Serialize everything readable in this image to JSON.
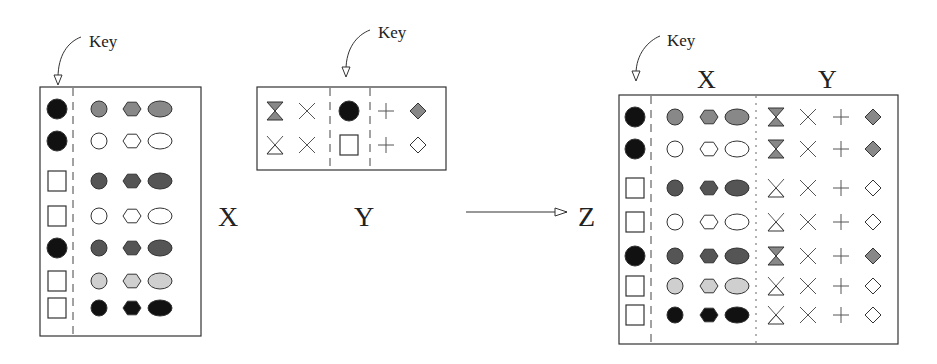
{
  "colors": {
    "black": "#111111",
    "dark_gray": "#555555",
    "mid_gray": "#888888",
    "light_gray": "#cfcfcf",
    "white": "#ffffff",
    "stroke": "#333333"
  },
  "labels": {
    "key_x": "Key",
    "key_y": "Key",
    "key_z": "Key",
    "table_x": "X",
    "table_y": "Y",
    "table_z": "Z",
    "z_header_x": "X",
    "z_header_y": "Y"
  },
  "table_x": {
    "key_column": [
      "filled-circle",
      "filled-circle",
      "empty-square",
      "empty-square",
      "filled-circle",
      "empty-square",
      "empty-square"
    ],
    "rows_fill": [
      "mid_gray",
      "white",
      "dark_gray",
      "white",
      "dark_gray",
      "light_gray",
      "black"
    ],
    "columns": [
      "circle",
      "hexagon",
      "ellipse"
    ]
  },
  "table_y": {
    "key_column": [
      "filled-circle",
      "empty-square"
    ],
    "left_rows": [
      [
        "hourglass-filled",
        "x-cross"
      ],
      [
        "hourglass-empty",
        "x-cross"
      ]
    ],
    "right_rows": [
      [
        "plus",
        "diamond-filled"
      ],
      [
        "plus",
        "diamond-empty"
      ]
    ]
  },
  "table_z": {
    "key_column": [
      "filled-circle",
      "filled-circle",
      "empty-square",
      "empty-square",
      "filled-circle",
      "empty-square",
      "empty-square"
    ],
    "x_rows_fill": [
      "mid_gray",
      "white",
      "dark_gray",
      "white",
      "dark_gray",
      "light_gray",
      "black"
    ],
    "y_rows": [
      [
        "hourglass-filled",
        "x-cross",
        "plus",
        "diamond-filled"
      ],
      [
        "hourglass-filled",
        "x-cross",
        "plus",
        "diamond-filled"
      ],
      [
        "hourglass-empty",
        "x-cross",
        "plus",
        "diamond-empty"
      ],
      [
        "hourglass-empty",
        "x-cross",
        "plus",
        "diamond-empty"
      ],
      [
        "hourglass-filled",
        "x-cross",
        "plus",
        "diamond-filled"
      ],
      [
        "hourglass-empty",
        "x-cross",
        "plus",
        "diamond-empty"
      ],
      [
        "hourglass-empty",
        "x-cross",
        "plus",
        "diamond-empty"
      ]
    ]
  },
  "arrow": {
    "from": "Y",
    "to": "Z"
  }
}
